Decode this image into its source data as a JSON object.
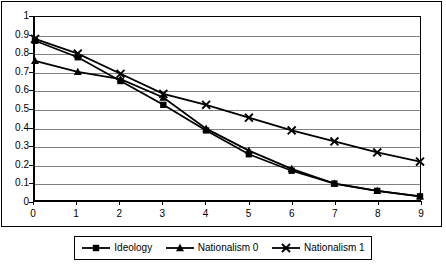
{
  "chart_data": {
    "type": "line",
    "title": "",
    "subtitle": "",
    "xlabel": "",
    "ylabel": "",
    "x": [
      0,
      1,
      2,
      3,
      4,
      5,
      6,
      7,
      8,
      9
    ],
    "xticklabels": [
      "0",
      "1",
      "2",
      "3",
      "4",
      "5",
      "6",
      "7",
      "8",
      "9"
    ],
    "yticklabels": [
      "1",
      "0.9",
      "0.8",
      "0.7",
      "0.6",
      "0.5",
      "0.4",
      "0.3",
      "0.2",
      "0.1",
      "0"
    ],
    "yticks": [
      1,
      0.9,
      0.8,
      0.7,
      0.6,
      0.5,
      0.4,
      0.3,
      0.2,
      0.1,
      0
    ],
    "xlim": [
      0,
      9
    ],
    "ylim": [
      0,
      1
    ],
    "grid": "horizontal",
    "legend_position": "bottom",
    "series": [
      {
        "name": "Ideology",
        "marker": "square",
        "color": "#000000",
        "values": [
          0.87,
          0.78,
          0.65,
          0.52,
          0.38,
          0.25,
          0.16,
          0.09,
          0.05,
          0.02
        ]
      },
      {
        "name": "Nationalism 0",
        "marker": "triangle",
        "color": "#000000",
        "values": [
          0.76,
          0.7,
          0.66,
          0.56,
          0.39,
          0.27,
          0.17,
          0.09,
          0.05,
          0.02
        ]
      },
      {
        "name": "Nationalism 1",
        "marker": "x",
        "color": "#000000",
        "values": [
          0.88,
          0.8,
          0.69,
          0.58,
          0.52,
          0.45,
          0.38,
          0.32,
          0.26,
          0.21
        ]
      }
    ]
  },
  "legend": {
    "entries": [
      {
        "label": "Ideology",
        "marker": "square-marker-icon"
      },
      {
        "label": "Nationalism 0",
        "marker": "triangle-marker-icon"
      },
      {
        "label": "Nationalism 1",
        "marker": "x-marker-icon"
      }
    ]
  }
}
